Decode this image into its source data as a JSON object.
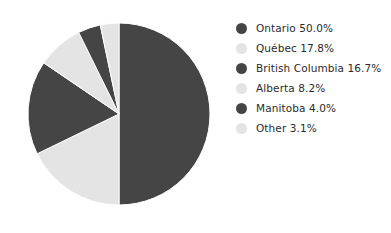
{
  "chart_data": {
    "type": "pie",
    "title": "",
    "subtitle": "",
    "xlabel": "",
    "ylabel": "",
    "grid": false,
    "legend_position": "right",
    "start_angle_deg": 0,
    "direction": "clockwise",
    "categories": [
      "Ontario",
      "Québec",
      "British Columbia",
      "Alberta",
      "Manitoba",
      "Other"
    ],
    "values": [
      50.0,
      17.8,
      16.7,
      8.2,
      4.0,
      3.1
    ],
    "value_suffix": "%",
    "colors": [
      "#454545",
      "#e4e4e4",
      "#454545",
      "#e4e4e4",
      "#454545",
      "#e4e4e4"
    ],
    "slices": [
      {
        "label": "Ontario",
        "value": 50.0,
        "display": "Ontario 50.0%",
        "color": "#454545",
        "start_deg": 0.0,
        "end_deg": 180.0
      },
      {
        "label": "Québec",
        "value": 17.8,
        "display": "Québec 17.8%",
        "color": "#e4e4e4",
        "start_deg": 180.0,
        "end_deg": 244.08
      },
      {
        "label": "British Columbia",
        "value": 16.7,
        "display": "British Columbia 16.7%",
        "color": "#454545",
        "start_deg": 244.08,
        "end_deg": 304.2
      },
      {
        "label": "Alberta",
        "value": 8.2,
        "display": "Alberta 8.2%",
        "color": "#e4e4e4",
        "start_deg": 304.2,
        "end_deg": 333.72
      },
      {
        "label": "Manitoba",
        "value": 4.0,
        "display": "Manitoba 4.0%",
        "color": "#454545",
        "start_deg": 333.72,
        "end_deg": 348.12
      },
      {
        "label": "Other",
        "value": 3.1,
        "display": "Other 3.1%",
        "color": "#e4e4e4",
        "start_deg": 348.12,
        "end_deg": 360.0
      }
    ]
  },
  "legend": {
    "items": [
      {
        "label": "Ontario 50.0%",
        "color": "#454545",
        "marker": "circle-marker"
      },
      {
        "label": "Québec 17.8%",
        "color": "#e4e4e4",
        "marker": "circle-marker"
      },
      {
        "label": "British Columbia 16.7%",
        "color": "#454545",
        "marker": "circle-marker"
      },
      {
        "label": "Alberta 8.2%",
        "color": "#e4e4e4",
        "marker": "circle-marker"
      },
      {
        "label": "Manitoba 4.0%",
        "color": "#454545",
        "marker": "circle-marker"
      },
      {
        "label": "Other 3.1%",
        "color": "#e4e4e4",
        "marker": "circle-marker"
      }
    ]
  },
  "canvas": {
    "background": "#ffffff",
    "pie_center_x": 93,
    "pie_center_y": 93,
    "pie_radius": 91
  }
}
